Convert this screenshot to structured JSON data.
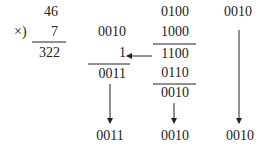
{
  "multiplication": {
    "multiplicand": "46",
    "operator": "×)",
    "multiplier": "7",
    "product": "322"
  },
  "column_tens": {
    "top": "0010",
    "carry": "1",
    "sum": "0011",
    "result": "0011"
  },
  "column_ones": {
    "top": "0100",
    "addend": "1000",
    "sum": "1100",
    "correction": "0110",
    "corrected": "0010",
    "result": "0010"
  },
  "column_hundreds": {
    "top": "0010",
    "result": "0010"
  },
  "colors": {
    "ink": "#222222",
    "background": "#ffffff"
  }
}
